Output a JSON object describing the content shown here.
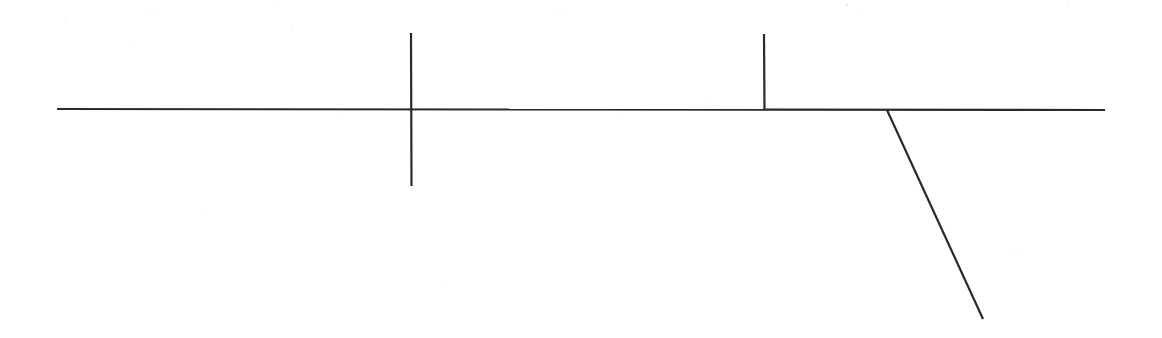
{
  "document": {
    "kind": "scanned-line-drawing",
    "title": "Line diagram",
    "width": 1162,
    "height": 338,
    "background_color": "#ffffff",
    "ink_color": "#2a2a2e",
    "notes": "No text, labels, axis ticks or legend are present in the image; only ink strokes on white paper."
  },
  "chart_data": {
    "type": "line",
    "title": "",
    "xlabel": "",
    "ylabel": "",
    "xlim": [
      0,
      1162
    ],
    "ylim": [
      338,
      0
    ],
    "grid": false,
    "legend": "none",
    "categories": [],
    "values": [],
    "annotations": [],
    "series": [
      {
        "name": "baseline",
        "role": "horizontal-axis-line",
        "stroke": "#2a2a2e",
        "stroke_width": 2.1,
        "points": [
          [
            57,
            109
          ],
          [
            1105,
            110
          ]
        ]
      },
      {
        "name": "tick-cross-left",
        "role": "full-crossing-tick",
        "stroke": "#2a2a2e",
        "stroke_width": 2.2,
        "points": [
          [
            411,
            33
          ],
          [
            411.5,
            186
          ]
        ]
      },
      {
        "name": "tick-upper-right",
        "role": "upper-only-tick",
        "stroke": "#2a2a2e",
        "stroke_width": 2.2,
        "points": [
          [
            764,
            34
          ],
          [
            764.5,
            110
          ]
        ]
      },
      {
        "name": "branch-diagonal",
        "role": "descending-branch",
        "stroke": "#2a2a2e",
        "stroke_width": 2.2,
        "points": [
          [
            887,
            110
          ],
          [
            983,
            319
          ]
        ]
      }
    ]
  },
  "strokes": [
    {
      "id": "baseline",
      "label": "Horizontal baseline",
      "x1": 57,
      "y1": 109,
      "x2": 1105,
      "y2": 110,
      "width": 2.1
    },
    {
      "id": "tick-cross-left",
      "label": "Left tick mark crossing the baseline",
      "x1": 411,
      "y1": 33,
      "x2": 411.5,
      "y2": 186,
      "width": 2.2
    },
    {
      "id": "tick-upper-right",
      "label": "Right tick mark above the baseline",
      "x1": 764,
      "y1": 34,
      "x2": 764.5,
      "y2": 110,
      "width": 2.2
    },
    {
      "id": "branch-diagonal",
      "label": "Diagonal branch descending to the lower right",
      "x1": 887,
      "y1": 110,
      "x2": 983,
      "y2": 319,
      "width": 2.2
    }
  ],
  "speckles": [
    {
      "x": 152,
      "y": 12,
      "r": 1.1,
      "o": 0.18
    },
    {
      "x": 278,
      "y": 6,
      "r": 0.9,
      "o": 0.14
    },
    {
      "x": 66,
      "y": 22,
      "r": 1.0,
      "o": 0.16
    },
    {
      "x": 131,
      "y": 41,
      "r": 0.8,
      "o": 0.12
    },
    {
      "x": 292,
      "y": 30,
      "r": 0.9,
      "o": 0.13
    },
    {
      "x": 560,
      "y": 9,
      "r": 1.0,
      "o": 0.15
    },
    {
      "x": 847,
      "y": 5,
      "r": 1.2,
      "o": 0.2
    },
    {
      "x": 862,
      "y": 14,
      "r": 0.9,
      "o": 0.13
    },
    {
      "x": 1068,
      "y": 3,
      "r": 1.0,
      "o": 0.16
    },
    {
      "x": 424,
      "y": 97,
      "r": 0.8,
      "o": 0.1
    },
    {
      "x": 618,
      "y": 113,
      "r": 0.9,
      "o": 0.11
    },
    {
      "x": 338,
      "y": 118,
      "r": 0.8,
      "o": 0.1
    },
    {
      "x": 709,
      "y": 101,
      "r": 0.8,
      "o": 0.1
    },
    {
      "x": 205,
      "y": 214,
      "r": 0.9,
      "o": 0.09
    },
    {
      "x": 447,
      "y": 286,
      "r": 0.8,
      "o": 0.09
    },
    {
      "x": 1016,
      "y": 252,
      "r": 0.9,
      "o": 0.1
    }
  ]
}
